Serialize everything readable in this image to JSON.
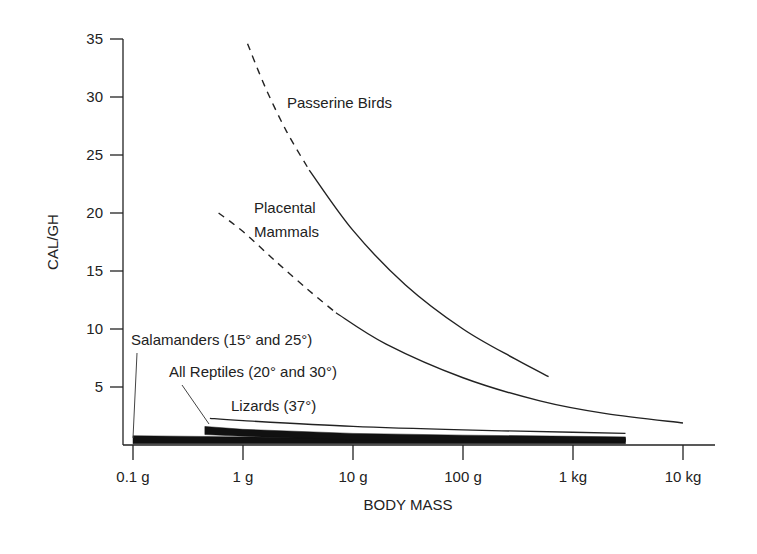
{
  "chart_data": {
    "type": "line",
    "title": "",
    "xlabel": "BODY MASS",
    "ylabel": "CAL/GH",
    "xscale": "log",
    "x_ticks": [
      {
        "value_g": 0.1,
        "label": "0.1 g"
      },
      {
        "value_g": 1,
        "label": "1 g"
      },
      {
        "value_g": 10,
        "label": "10 g"
      },
      {
        "value_g": 100,
        "label": "100 g"
      },
      {
        "value_g": 1000,
        "label": "1 kg"
      },
      {
        "value_g": 10000,
        "label": "10 kg"
      }
    ],
    "y_ticks": [
      5,
      10,
      15,
      20,
      25,
      30,
      35
    ],
    "ylim": [
      0,
      35
    ],
    "xlim_g": [
      0.1,
      15000
    ],
    "grid": false,
    "legend": "none (direct labels)",
    "series": [
      {
        "name": "Passerine Birds",
        "style": "line",
        "dashed_segment": {
          "x_g": [
            1.1,
            1.6,
            2.5,
            4.0
          ],
          "y": [
            34.6,
            30.8,
            27.0,
            23.7
          ]
        },
        "solid_segment": {
          "x_g": [
            4.0,
            10,
            30,
            100,
            300,
            600
          ],
          "y": [
            23.7,
            18.5,
            13.8,
            10.0,
            7.4,
            5.9
          ]
        }
      },
      {
        "name": "Placental Mammals",
        "style": "line",
        "dashed_segment": {
          "x_g": [
            0.6,
            1.0,
            2.0,
            4.0,
            7.0
          ],
          "y": [
            20.0,
            18.4,
            15.8,
            13.3,
            11.4
          ]
        },
        "solid_segment": {
          "x_g": [
            7.0,
            20,
            100,
            500,
            2000,
            10000
          ],
          "y": [
            11.4,
            8.7,
            5.8,
            3.8,
            2.7,
            1.9
          ]
        }
      },
      {
        "name": "Salamanders (15° and 25°)",
        "style": "band",
        "x_g": [
          0.1,
          1,
          10,
          100,
          1000,
          3000
        ],
        "upper": [
          0.8,
          0.7,
          0.6,
          0.55,
          0.55,
          0.55
        ],
        "lower": [
          0.1,
          0.1,
          0.1,
          0.1,
          0.1,
          0.1
        ]
      },
      {
        "name": "All Reptiles (20° and 30°)",
        "style": "band",
        "x_g": [
          0.45,
          1,
          10,
          100,
          1000,
          3000
        ],
        "upper": [
          1.6,
          1.35,
          1.0,
          0.85,
          0.75,
          0.7
        ],
        "lower": [
          0.9,
          0.75,
          0.45,
          0.35,
          0.3,
          0.3
        ]
      },
      {
        "name": "Lizards (37°)",
        "style": "line",
        "x_g": [
          0.5,
          1,
          10,
          100,
          1000,
          3000
        ],
        "y": [
          2.3,
          2.1,
          1.6,
          1.3,
          1.1,
          1.0
        ]
      }
    ],
    "annotations": [
      {
        "text": "Passerine Birds",
        "x_px": 287,
        "y_px": 108
      },
      {
        "text": "Placental",
        "x_px": 254,
        "y_px": 213
      },
      {
        "text": "Mammals",
        "x_px": 254,
        "y_px": 237
      },
      {
        "text": "Salamanders (15° and 25°)",
        "x_px": 131,
        "y_px": 345,
        "leader_to": [
          133,
          438
        ]
      },
      {
        "text": "All Reptiles (20° and 30°)",
        "x_px": 169,
        "y_px": 377,
        "leader_to": [
          209,
          424
        ]
      },
      {
        "text": "Lizards (37°)",
        "x_px": 231,
        "y_px": 411
      }
    ]
  }
}
